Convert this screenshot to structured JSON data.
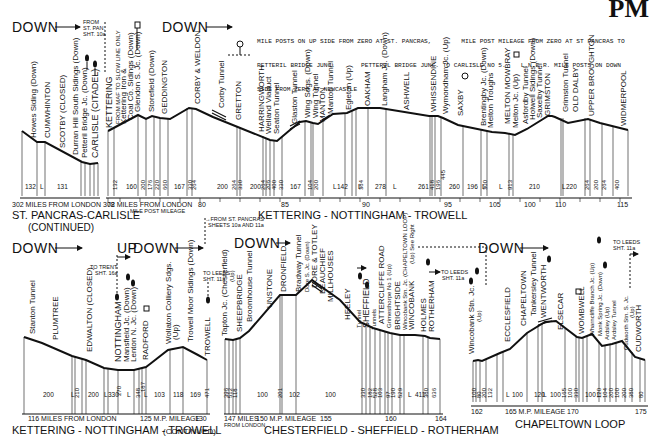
{
  "corner_heading": "PM",
  "notes": {
    "top_line1": "MILE POSTS ON UP SIDE FROM ZERO AT ST. PANCRAS,        MILE POST MILEAGE FROM ZERO AT ST PANCRAS TO",
    "top_line2": "PETTERIL BRIDGE JUNC.       PETTERIL BRIDGE JUNC. TO CARLISLE NO 5.    L.N.E.R. MILE POSTS ON DOWN",
    "top_line3": "SIDE FROM ZERO AT NEWCASTLE"
  },
  "panels": [
    {
      "id": "st-pancras-carlisle-continued",
      "title": "ST. PANCRAS-CARLISLE",
      "subtitle": "(CONTINUED)",
      "direction": "DOWN",
      "axis_label": "302 MILES FROM LONDON 308",
      "connector": "FROM ST. PAN. SHT. 10a",
      "stations": [
        "Howes Siding (Down)",
        "CUMWHINTON",
        "SCOTBY (CLOSED)",
        "Durran Hill South Sidings (Down)",
        "Petteril Bridge Jc. (Down)",
        "CARLISLE (CITADEL)"
      ],
      "gradients": [
        "132",
        "L",
        "131",
        "340",
        "135",
        "225",
        "330"
      ]
    },
    {
      "id": "kettering-nottingham-trowell",
      "title": "KETTERING - NOTTINGHAM - TROWELL",
      "direction": "DOWN",
      "axis_label_left": "72 MILES FROM LONDON",
      "axis_sublabel": "MILE POST MILEAGE",
      "axis_ticks": [
        "80",
        "85",
        "90",
        "95",
        "100",
        "105",
        "110",
        "115"
      ],
      "slow_line_note": "FROM MAF TO SLOW LINE ONLY",
      "stations": [
        "KETTERING",
        "Kettering Iron & Coal Co. Sidings (Down)",
        "Glendon S. Jc. (Down)",
        "Storefield (Down)",
        "GEDDINGTON",
        "CORBY & WELDON",
        "Corby Tunnel",
        "GRETTON",
        "HARRINGWORTH",
        "Welland Viaduct",
        "Seaton Tunnel",
        "Glaston Tunnel",
        "Wing Sdgs. (Down)",
        "Wing Tunnel",
        "MANTON",
        "Manton Tunnel",
        "Egleton (Up)",
        "OAKHAM",
        "Langham Jc. (Down)",
        "ASHWELL",
        "WHISSENDINE",
        "Wymondham Jc. (Up)",
        "SAXBY",
        "Brentingby Jc. (Down)",
        "Melton Troughs",
        "MELTON MOWBRAY",
        "Melton Jc. (Up)",
        "Asfordby Tunnel",
        "Holwell Sidings (Down)",
        "Saxelby Tunnel",
        "GRIMSTON",
        "Grimston Tunnel",
        "OLD DALBY",
        "UPPER BROUGHTON",
        "WIDMERPOOL"
      ],
      "gradients": [
        "132",
        "160",
        "200",
        "176",
        "220",
        "660",
        "167",
        "330",
        "264",
        "200",
        "264",
        "330",
        "200",
        "264",
        "206",
        "400",
        "167",
        "330",
        "167",
        "104",
        "176",
        "200",
        "L",
        "142",
        "L",
        "384",
        "278",
        "L",
        "261",
        "80",
        "L",
        "418",
        "445",
        "196",
        "260",
        "196",
        "L",
        "300",
        "L",
        "413",
        "913",
        "220",
        "L",
        "220",
        "264",
        "200",
        "264",
        "400"
      ]
    },
    {
      "id": "kettering-nottingham-trowell-continued",
      "title": "KETTERING - NOTTINGHAM - TROWELL",
      "title_suffix": "(CONTINUED)",
      "direction_up": "UP",
      "direction": "DOWN",
      "axis_label_left": "116 MILES FROM LONDON",
      "axis_sublabel": "M.P. MILEAGE",
      "axis_ticks": [
        "125",
        "130"
      ],
      "connectors": [
        "TO TRENT SHT. 16a",
        "TO LEEDS SHT. 11a"
      ],
      "stations": [
        "Stanton Tunnel",
        "PLUMTREE",
        "EDWALTON (CLOSED)",
        "NOTTINGHAM",
        "Mansfield Jc. (Down)",
        "Lenton N. Jc. (Down)",
        "RADFORD",
        "Wollaton Colliery Sdgs. (Up)",
        "Trowell Moor Sidings (Down)",
        "TROWELL"
      ],
      "gradients": [
        "200",
        "L",
        "210",
        "L",
        "200",
        "L",
        "330",
        "270",
        "L",
        "348",
        "187",
        "L",
        "103",
        "118",
        "169",
        "471"
      ]
    },
    {
      "id": "chesterfield-sheffield-rotherham",
      "title": "CHESTERFIELD - SHEFFIELD - ROTHERHAM",
      "direction": "DOWN",
      "axis_label_left": "147 MILES FROM LONDON",
      "axis_sublabel": "M.P. MILEAGE",
      "axis_ticks": [
        "150",
        "155",
        "160",
        "164"
      ],
      "connectors": [
        "FROM ST. PANCRAS SHEETS 10a AND 11a",
        "TO LEEDS SHT. 11a"
      ],
      "stations": [
        "Tapton Jc. (Chesterfield) (Up)",
        "SHEEPBRIDGE",
        "Broomhouse Tunnel",
        "UNSTONE",
        "DRONFIELD",
        "Bradway Tunnel",
        "Dore S. Jc. (Down)",
        "DORE & TOTLEY",
        "BEAUCHIEF",
        "MILLHOUSES",
        "HEELEY",
        "Tunnel",
        "SHEFFIELD",
        "Tunnels",
        "ATTERCLIFFE ROAD",
        "Grimesthorpe No 1 (Up)",
        "BRIGHTSIDE",
        "Wincobank Stn. Jc. (CHAPELTOWN LOOP) (Up) See Right",
        "WINCOBANK",
        "HOLMES",
        "ROTHERHAM"
      ],
      "gradients": [
        "396",
        "L",
        "512",
        "176",
        "118",
        "100",
        "201",
        "102",
        "100",
        "330",
        "182",
        "528",
        "103",
        "L",
        "97",
        "190",
        "529",
        "L",
        "411",
        "380",
        "636"
      ]
    },
    {
      "id": "chapeltown-loop",
      "title": "CHAPELTOWN LOOP",
      "direction": "DOWN",
      "axis_label_left": "162",
      "axis_sublabel": "M.P. MILEAGE",
      "axis_ticks": [
        "165",
        "170",
        "175"
      ],
      "connectors": [
        "TO LEEDS SHT. 11a"
      ],
      "stations": [
        "Wincobank Stn. Jc. (Up)",
        "ECCLESFIELD",
        "CHAPELTOWN",
        "Tankersley Tunnel",
        "WENTWORTH",
        "ELSECAR",
        "WOMBWELL",
        "Wharncliffe Branch Jc. (Up)",
        "Monk Spring Jc. (Down)",
        "Ardsley (Up)",
        "Ardsley Tunnel",
        "Cudworth Stn. S. Jc. (Up)",
        "CUDWORTH"
      ],
      "gradients": [
        "L",
        "100",
        "80",
        "200",
        "132",
        "L",
        "100",
        "120",
        "L",
        "100",
        "165",
        "L",
        "100",
        "330",
        "100",
        "L",
        "120",
        "104",
        "200",
        "100",
        "200",
        "380",
        "80"
      ]
    }
  ]
}
